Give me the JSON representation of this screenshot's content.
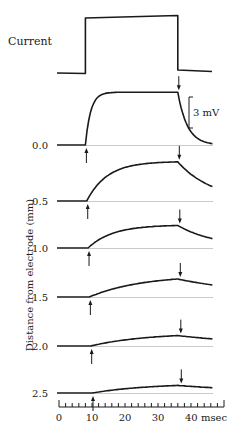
{
  "figure": {
    "current_label": "Current",
    "scale_bar_label": "3 mV",
    "y_axis_label": "Distance from electrode (mm)",
    "x_axis_unit": "msec"
  },
  "chart_data": {
    "type": "line",
    "title": "",
    "xlabel": "msec",
    "ylabel": "Distance from electrode (mm)",
    "x_ticks": [
      0,
      10,
      20,
      30,
      40
    ],
    "x_tick_labels": [
      "0",
      "10",
      "20",
      "30",
      "40 msec"
    ],
    "xlim": [
      0,
      50
    ],
    "minor_tick_interval": 2,
    "scale_bar": {
      "label": "3 mV",
      "value_mv": 3
    },
    "current_pulse": {
      "label": "Current",
      "on_ms": 8,
      "off_ms": 36
    },
    "stimulus_on_ms": 8,
    "stimulus_off_ms": 36,
    "series": [
      {
        "name": "0.0",
        "distance_mm": 0.0,
        "peak_mv": 4.8,
        "shape": "fast"
      },
      {
        "name": "0.5",
        "distance_mm": 0.5,
        "peak_mv": 3.6,
        "shape": "medium"
      },
      {
        "name": "1.0",
        "distance_mm": 1.0,
        "peak_mv": 2.1,
        "shape": "medium"
      },
      {
        "name": "1.5",
        "distance_mm": 1.5,
        "peak_mv": 2.0,
        "shape": "slow"
      },
      {
        "name": "2.0",
        "distance_mm": 2.0,
        "peak_mv": 1.2,
        "shape": "slow"
      },
      {
        "name": "2.5",
        "distance_mm": 2.5,
        "peak_mv": 0.9,
        "shape": "slow"
      }
    ],
    "legend": []
  }
}
